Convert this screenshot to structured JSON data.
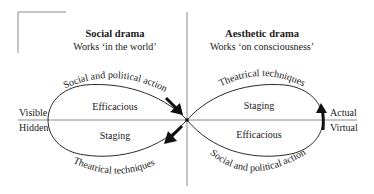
{
  "diagram": {
    "left_panel": {
      "title": "Social drama",
      "subtitle": "Works ‘in the world’",
      "upper_region": "Efficacious",
      "lower_region": "Staging",
      "upper_arc_label": "Social and political action",
      "lower_arc_label": "Theatrical techniques"
    },
    "right_panel": {
      "title": "Aesthetic drama",
      "subtitle": "Works ‘on consciousness’",
      "upper_region": "Staging",
      "lower_region": "Efficacious",
      "upper_arc_label": "Theatrical techniques",
      "lower_arc_label": "Social and political action"
    },
    "axis_labels": {
      "left_above": "Visible",
      "left_below": "Hidden",
      "right_above": "Actual",
      "right_below": "Virtual"
    },
    "colors": {
      "line": "#8a8a8a",
      "curve": "#2a2a2a",
      "arrow": "#111111",
      "text": "#1a1a1a"
    }
  }
}
